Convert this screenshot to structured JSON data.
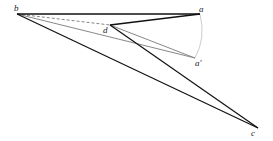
{
  "diagram": {
    "points": {
      "b": {
        "label": "b",
        "x": 17,
        "y": 14
      },
      "a": {
        "label": "a",
        "x": 200,
        "y": 14
      },
      "d": {
        "label": "d",
        "x": 110,
        "y": 25
      },
      "a_prime": {
        "label": "a'",
        "x": 195,
        "y": 58
      },
      "c": {
        "label": "c",
        "x": 258,
        "y": 128
      }
    },
    "colors": {
      "black_line": "#111111",
      "gray_line": "#888888",
      "arc": "#cccccc",
      "dashed": "#666666"
    }
  }
}
